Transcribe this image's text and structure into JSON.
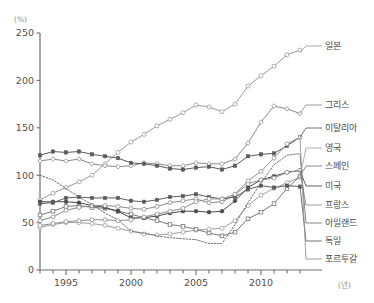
{
  "chart_data": {
    "type": "line",
    "title": "",
    "xlabel": "(년)",
    "ylabel": "(%)",
    "xlim": [
      1993,
      2013
    ],
    "ylim": [
      0,
      250
    ],
    "yticks": [
      0,
      50,
      100,
      150,
      200,
      250
    ],
    "xticks": [
      1995,
      2000,
      2005,
      2010
    ],
    "x": [
      1993,
      1994,
      1995,
      1996,
      1997,
      1998,
      1999,
      2000,
      2001,
      2002,
      2003,
      2004,
      2005,
      2006,
      2007,
      2008,
      2009,
      2010,
      2011,
      2012,
      2013
    ],
    "grid": false,
    "legend_position": "right-inline",
    "series": [
      {
        "name": "일본",
        "color": "#9a9a9a",
        "marker": "open-circle",
        "dash": "none",
        "values": [
          74,
          81,
          87,
          93,
          100,
          112,
          124,
          135,
          143,
          152,
          159,
          166,
          174,
          172,
          167,
          175,
          194,
          205,
          215,
          227,
          232
        ]
      },
      {
        "name": "그리스",
        "color": "#8a8a8a",
        "marker": "open-diamond",
        "dash": "none",
        "values": [
          115,
          117,
          115,
          117,
          112,
          110,
          109,
          110,
          113,
          112,
          110,
          110,
          113,
          112,
          112,
          117,
          134,
          156,
          173,
          170,
          165
        ]
      },
      {
        "name": "이탈리아",
        "color": "#5a5a5a",
        "marker": "filled-square",
        "dash": "none",
        "values": [
          121,
          125,
          124,
          125,
          122,
          120,
          118,
          113,
          112,
          110,
          107,
          106,
          108,
          109,
          106,
          110,
          120,
          122,
          123,
          131,
          140
        ]
      },
      {
        "name": "영국",
        "color": "#9e9e9e",
        "marker": "open-circle",
        "dash": "none",
        "values": [
          45,
          48,
          50,
          50,
          49,
          47,
          44,
          41,
          38,
          37,
          38,
          40,
          42,
          43,
          44,
          52,
          68,
          79,
          86,
          92,
          98
        ]
      },
      {
        "name": "스페인",
        "color": "#777777",
        "marker": "open-square",
        "dash": "none",
        "values": [
          58,
          62,
          67,
          68,
          66,
          65,
          62,
          59,
          55,
          52,
          48,
          46,
          43,
          39,
          36,
          40,
          54,
          61,
          70,
          86,
          99
        ]
      },
      {
        "name": "미국",
        "color": "#4a4a4a",
        "marker": "filled-circle",
        "dash": "none",
        "values": [
          72,
          72,
          72,
          71,
          68,
          66,
          62,
          55,
          55,
          57,
          60,
          62,
          62,
          61,
          62,
          73,
          87,
          95,
          99,
          103,
          105
        ]
      },
      {
        "name": "프랑스",
        "color": "#8c8c8c",
        "marker": "open-circle",
        "dash": "none",
        "values": [
          52,
          56,
          63,
          66,
          68,
          68,
          67,
          65,
          64,
          67,
          71,
          73,
          75,
          71,
          72,
          79,
          91,
          95,
          97,
          103,
          105
        ]
      },
      {
        "name": "아일랜드",
        "color": "#6f6f6f",
        "marker": "none",
        "dash": "dotted",
        "values": [
          100,
          95,
          86,
          77,
          69,
          60,
          53,
          41,
          39,
          36,
          34,
          33,
          32,
          28,
          28,
          48,
          71,
          92,
          111,
          121,
          123
        ]
      },
      {
        "name": "독일",
        "color": "#5c5c5c",
        "marker": "filled-square",
        "dash": "none",
        "values": [
          70,
          71,
          76,
          77,
          76,
          76,
          76,
          73,
          72,
          74,
          77,
          78,
          80,
          77,
          75,
          77,
          85,
          89,
          87,
          89,
          88
        ]
      },
      {
        "name": "포르투갈",
        "color": "#8f8f8f",
        "marker": "open-circle",
        "dash": "none",
        "values": [
          47,
          49,
          51,
          52,
          53,
          53,
          52,
          53,
          56,
          59,
          62,
          65,
          72,
          75,
          75,
          80,
          94,
          104,
          118,
          133,
          140
        ]
      }
    ],
    "legend_entries": [
      {
        "label": "일본",
        "anchor_value": 230,
        "label_y": 46
      },
      {
        "label": "그리스",
        "anchor_value": 165,
        "label_y": 105
      },
      {
        "label": "이탈리아",
        "anchor_value": 140,
        "label_y": 128
      },
      {
        "label": "영국",
        "anchor_value": 98,
        "label_y": 148
      },
      {
        "label": "스페인",
        "anchor_value": 99,
        "label_y": 166
      },
      {
        "label": "미국",
        "anchor_value": 105,
        "label_y": 186
      },
      {
        "label": "프랑스",
        "anchor_value": 105,
        "label_y": 205
      },
      {
        "label": "아일랜드",
        "anchor_value": 123,
        "label_y": 223
      },
      {
        "label": "독일",
        "anchor_value": 88,
        "label_y": 241
      },
      {
        "label": "포르투갈",
        "anchor_value": 140,
        "label_y": 259
      }
    ]
  }
}
